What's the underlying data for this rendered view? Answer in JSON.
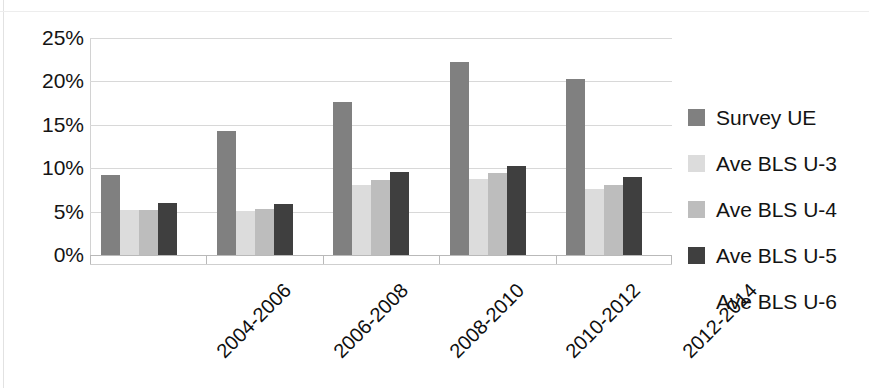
{
  "chart_data": {
    "type": "bar",
    "title": "",
    "subtitle": "",
    "xlabel": "",
    "ylabel": "",
    "grid": true,
    "legend_position": "right",
    "ylim": [
      0,
      25
    ],
    "y_tick_labels": [
      "25%",
      "20%",
      "15%",
      "10%",
      "5%",
      "0%"
    ],
    "y_tick_values": [
      25,
      20,
      15,
      10,
      5,
      0
    ],
    "categories": [
      "2004-2006",
      "2006-2008",
      "2008-2010",
      "2010-2012",
      "2012-2014"
    ],
    "series": [
      {
        "name": "Survey UE",
        "color": "#808080",
        "values": [
          9.2,
          14.3,
          17.6,
          22.2,
          20.3
        ]
      },
      {
        "name": "Ave BLS U-3",
        "color": "#dcdcdc",
        "values": [
          5.2,
          5.1,
          8.1,
          8.7,
          7.6
        ]
      },
      {
        "name": "Ave BLS U-4",
        "color": "#bdbdbd",
        "values": [
          5.2,
          5.3,
          8.6,
          9.4,
          8.1
        ]
      },
      {
        "name": "Ave BLS U-5",
        "color": "#3f3f3f",
        "values": [
          6.0,
          5.9,
          9.6,
          10.3,
          9.0
        ]
      },
      {
        "name": "Ave BLS U-6",
        "color": "#ffffff",
        "values": [
          0,
          0,
          0,
          0,
          0
        ]
      }
    ]
  },
  "axis": {
    "y_ticks": [
      {
        "label": "25%",
        "value": 25
      },
      {
        "label": "20%",
        "value": 20
      },
      {
        "label": "15%",
        "value": 15
      },
      {
        "label": "10%",
        "value": 10
      },
      {
        "label": "5%",
        "value": 5
      },
      {
        "label": "0%",
        "value": 0
      }
    ]
  },
  "legend": {
    "items": [
      {
        "label": "Survey UE",
        "color": "#808080",
        "has_swatch": true
      },
      {
        "label": "Ave BLS U-3",
        "color": "#dcdcdc",
        "has_swatch": true
      },
      {
        "label": "Ave BLS U-4",
        "color": "#bdbdbd",
        "has_swatch": true
      },
      {
        "label": "Ave BLS U-5",
        "color": "#3f3f3f",
        "has_swatch": true
      },
      {
        "label": "Ave BLS U-6",
        "color": "#ffffff",
        "has_swatch": false
      }
    ]
  }
}
